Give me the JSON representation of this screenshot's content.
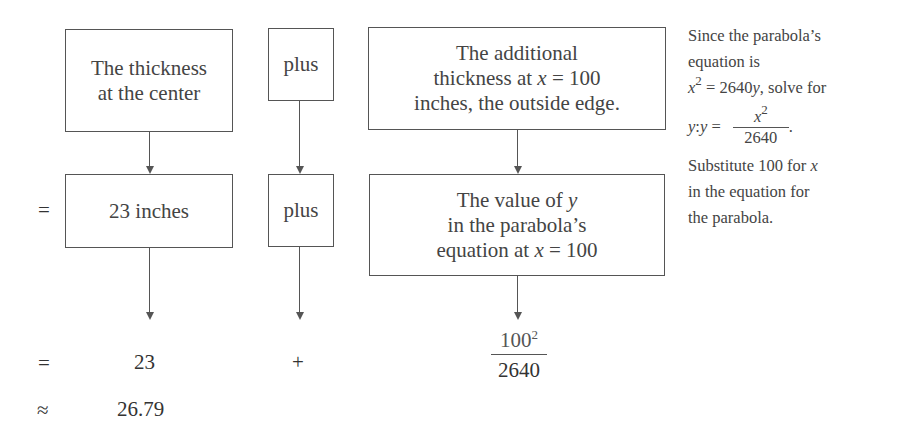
{
  "diagram": {
    "top_row": {
      "box_center_thickness": [
        "The thickness",
        "at the center"
      ],
      "plus_label_1": "plus",
      "box_additional_thickness": [
        "The additional",
        "thickness at ",
        "x",
        " = 100",
        "inches, the outside edge."
      ]
    },
    "middle_row": {
      "equals_symbol": "=",
      "box_23_inches": "23 inches",
      "plus_label_2": "plus",
      "box_value_of_y": [
        "The value of ",
        "y",
        "in the parabola’s",
        "equation at ",
        "x",
        " = 100"
      ]
    },
    "bottom_row": {
      "equals_symbol": "=",
      "value_23": "23",
      "plus_symbol": "+",
      "fraction_numerator": "100",
      "fraction_numerator_exponent": "2",
      "fraction_denominator": "2640",
      "approx_symbol": "≈",
      "result": "26.79"
    },
    "side_note": {
      "line1": "Since the parabola’s",
      "line2": "equation is",
      "line3_var": "x",
      "line3_exp": "2",
      "line3_rest": " = 2640",
      "line3_var2": "y",
      "line3_tail": ", solve for",
      "line4_var": "y",
      "line4_mid": ": ",
      "line4_var2": "y",
      "line4_eq": " = ",
      "line4_frac_num_var": "x",
      "line4_frac_num_exp": "2",
      "line4_frac_den": "2640",
      "line4_tail": ".",
      "line5": "Substitute 100 for ",
      "line5_var": "x",
      "line6": "in the equation for",
      "line7": "the parabola."
    }
  }
}
